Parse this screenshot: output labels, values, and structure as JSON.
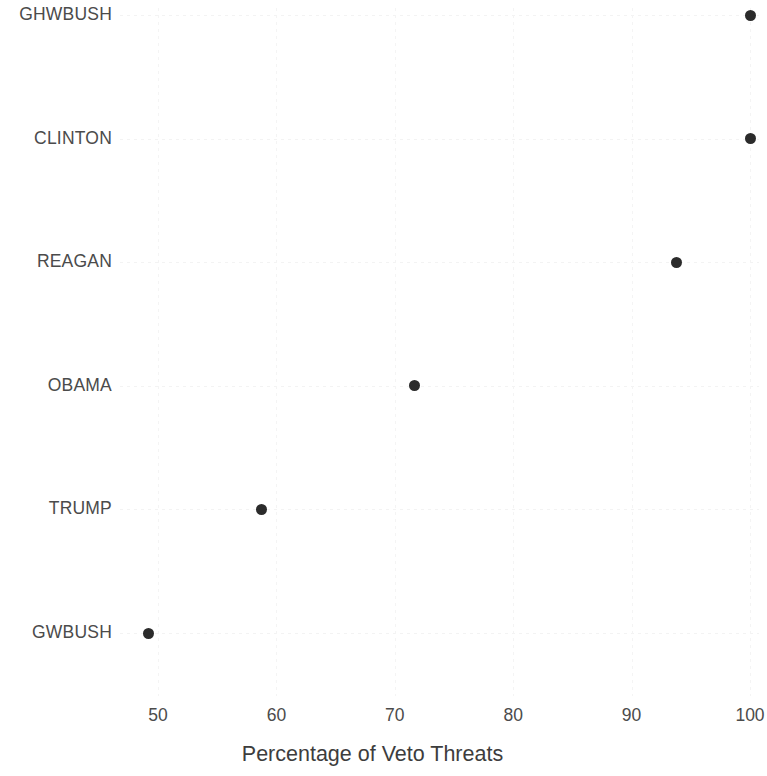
{
  "chart_data": {
    "type": "scatter",
    "subtype": "dot-plot",
    "title": "",
    "subtitle": "",
    "xlabel": "Percentage of Veto Threats",
    "ylabel": "",
    "xlim": [
      47.5,
      101.5
    ],
    "xticks": [
      50,
      60,
      70,
      80,
      90,
      100
    ],
    "xtick_labels": [
      "50",
      "60",
      "70",
      "80",
      "90",
      "100"
    ],
    "categories": [
      "GHWBUSH",
      "CLINTON",
      "REAGAN",
      "OBAMA",
      "TRUMP",
      "GWBUSH"
    ],
    "values": [
      100.0,
      100.0,
      93.8,
      71.7,
      58.7,
      49.2
    ],
    "points": [
      {
        "category": "GHWBUSH",
        "value": 100.0
      },
      {
        "category": "CLINTON",
        "value": 100.0
      },
      {
        "category": "REAGAN",
        "value": 93.8
      },
      {
        "category": "OBAMA",
        "value": 71.7
      },
      {
        "category": "TRUMP",
        "value": 58.7
      },
      {
        "category": "GWBUSH",
        "value": 49.2
      }
    ],
    "grid": true,
    "grid_style": "dotted-faint",
    "legend": "none",
    "marker": "circle",
    "marker_color": "#2b2b2b",
    "marker_size_px": 11,
    "background_color": "#ffffff",
    "text_color": "#4b4b4b",
    "gridline_color": "#f3f3f3"
  },
  "axis": {
    "x_title": "Percentage of Veto Threats",
    "tick_labels": [
      "50",
      "60",
      "70",
      "80",
      "90",
      "100"
    ]
  },
  "category_labels": [
    "GHWBUSH",
    "CLINTON",
    "REAGAN",
    "OBAMA",
    "TRUMP",
    "GWBUSH"
  ]
}
